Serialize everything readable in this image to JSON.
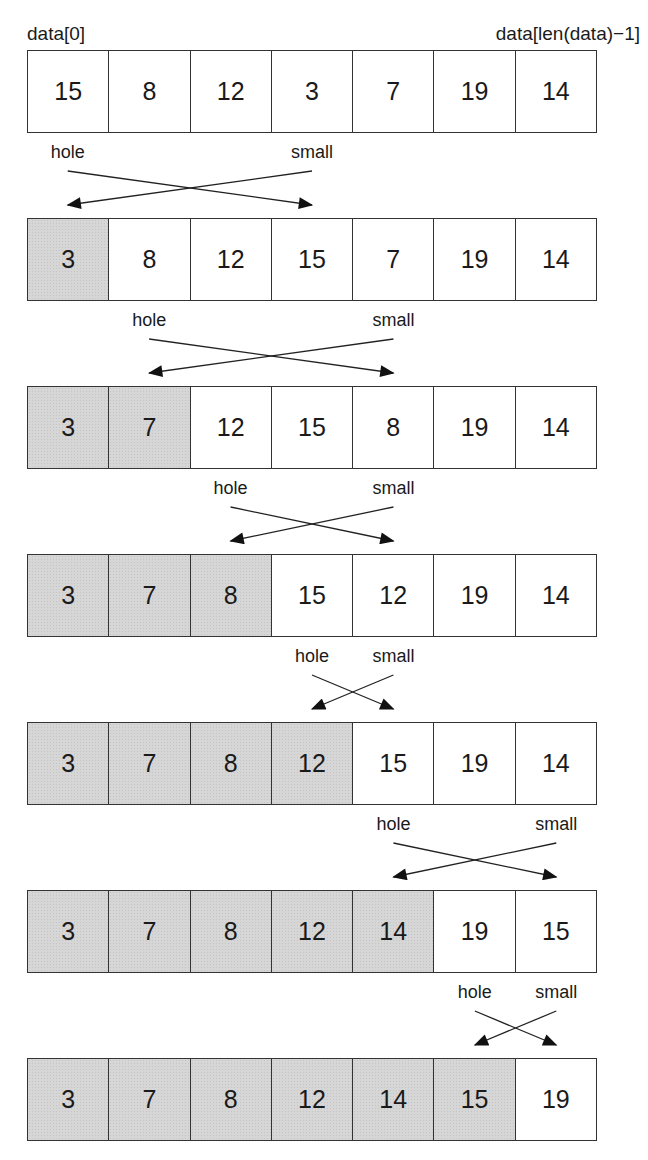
{
  "labels": {
    "first_index": "data[0]",
    "last_index": "data[len(data)−1]",
    "hole": "hole",
    "small": "small"
  },
  "colors": {
    "sorted_fill": "#d6d6d6",
    "unsorted_fill": "#ffffff",
    "stroke": "#333333"
  },
  "steps": [
    {
      "values": [
        15,
        8,
        12,
        3,
        7,
        19,
        14
      ],
      "sorted_count": 0,
      "swap": {
        "hole": 0,
        "small": 3
      }
    },
    {
      "values": [
        3,
        8,
        12,
        15,
        7,
        19,
        14
      ],
      "sorted_count": 1,
      "swap": {
        "hole": 1,
        "small": 4
      }
    },
    {
      "values": [
        3,
        7,
        12,
        15,
        8,
        19,
        14
      ],
      "sorted_count": 2,
      "swap": {
        "hole": 2,
        "small": 4
      }
    },
    {
      "values": [
        3,
        7,
        8,
        15,
        12,
        19,
        14
      ],
      "sorted_count": 3,
      "swap": {
        "hole": 3,
        "small": 4
      }
    },
    {
      "values": [
        3,
        7,
        8,
        12,
        15,
        19,
        14
      ],
      "sorted_count": 4,
      "swap": {
        "hole": 4,
        "small": 6
      }
    },
    {
      "values": [
        3,
        7,
        8,
        12,
        14,
        19,
        15
      ],
      "sorted_count": 5,
      "swap": {
        "hole": 5,
        "small": 6
      }
    },
    {
      "values": [
        3,
        7,
        8,
        12,
        14,
        15,
        19
      ],
      "sorted_count": 6,
      "swap": null
    }
  ]
}
